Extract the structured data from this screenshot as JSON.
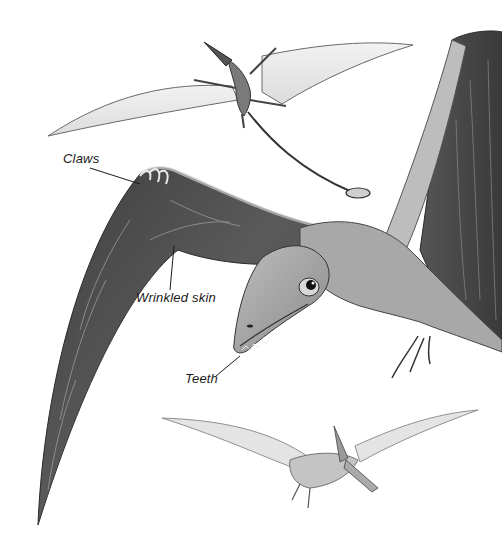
{
  "illustration": {
    "subject": "Pterosaurs in flight",
    "figures": [
      {
        "id": "small-long-tailed-pterosaur",
        "position": "top"
      },
      {
        "id": "large-pterosaur-closeup",
        "position": "center-right"
      },
      {
        "id": "crested-pterosaur",
        "position": "bottom"
      }
    ],
    "style": "grayscale pencil drawing",
    "colors": {
      "background": "#ffffff",
      "wing_dark": "#4a4a4a",
      "wing_light": "#e6e6e6",
      "ink": "#1a1a1a"
    }
  },
  "labels": {
    "claws": "Claws",
    "wrinkled_skin": "Wrinkled skin",
    "teeth": "Teeth"
  }
}
